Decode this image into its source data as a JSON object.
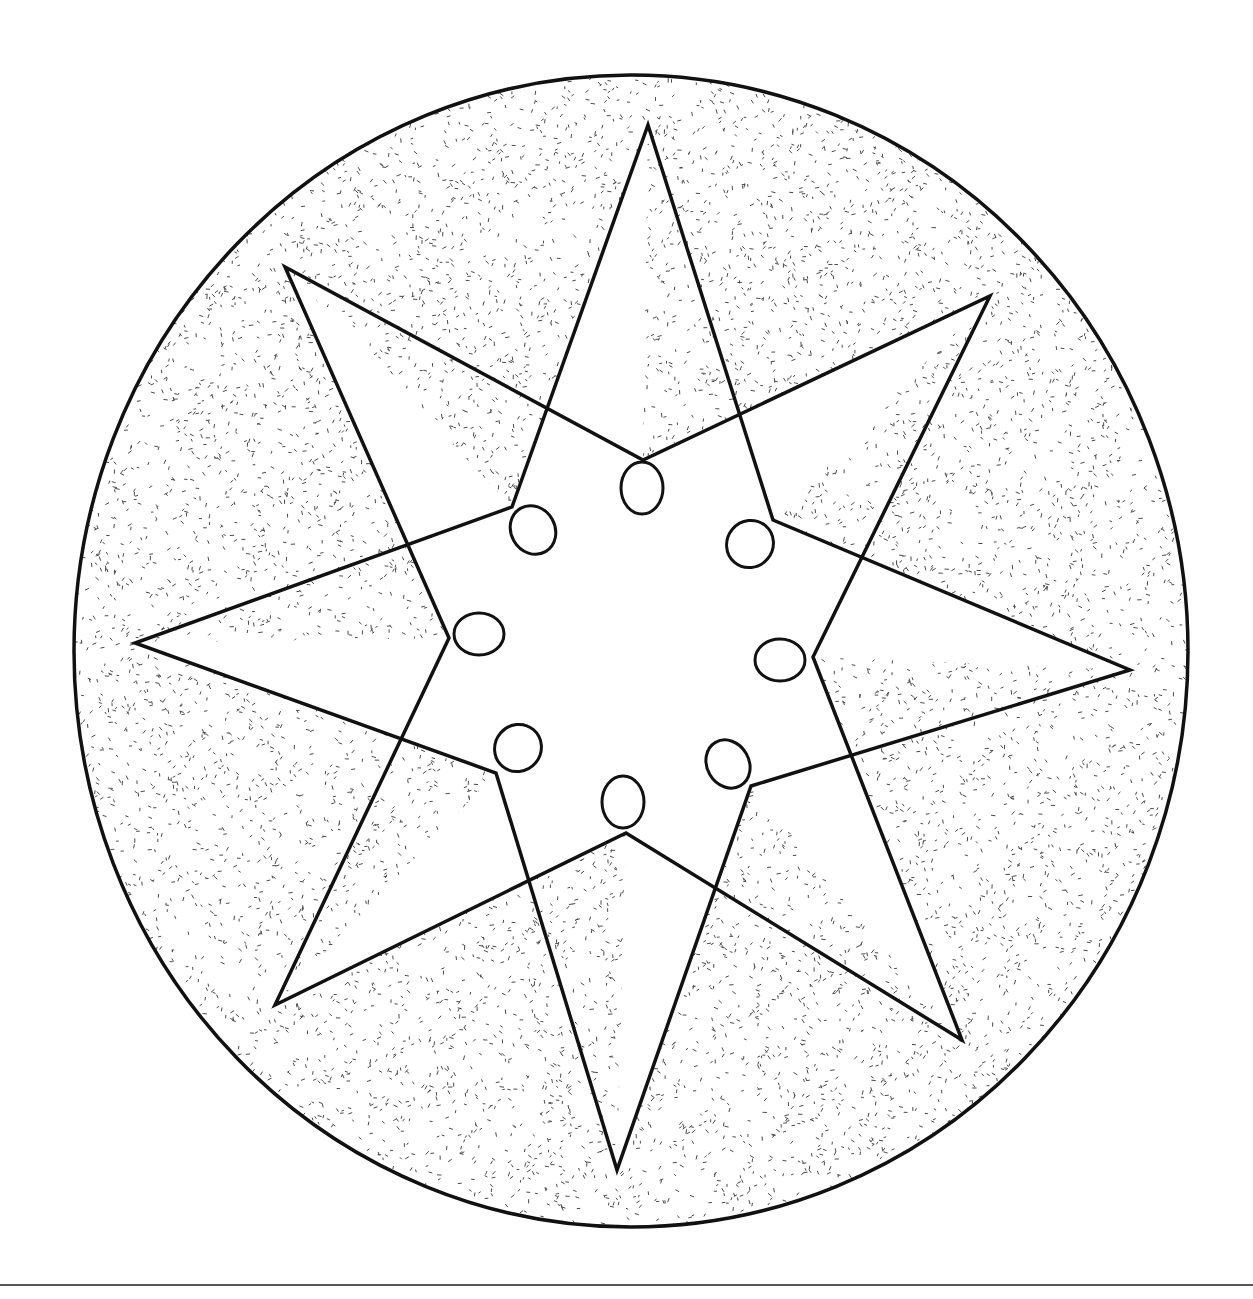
{
  "diagram": {
    "title": "",
    "colors": {
      "background": "#ffffff",
      "stroke": "#111111",
      "stipple": "#4a4a4a",
      "fill_inside": "#ffffff",
      "rule": "#555555"
    },
    "outer_circle": {
      "cx": 631,
      "cy": 651,
      "rx": 557,
      "ry": 576,
      "stroke_width": 3.5
    },
    "star": {
      "stroke_width": 3.5,
      "points": [
        [
          648,
          125
        ],
        [
          643,
          460
        ],
        [
          990,
          296
        ],
        [
          773,
          520
        ],
        [
          1130,
          670
        ],
        [
          813,
          657
        ],
        [
          962,
          1040
        ],
        [
          751,
          786
        ],
        [
          617,
          1170
        ],
        [
          626,
          833
        ],
        [
          275,
          1005
        ],
        [
          496,
          773
        ],
        [
          135,
          643
        ],
        [
          449,
          638
        ],
        [
          285,
          267
        ],
        [
          512,
          507
        ]
      ],
      "star_outline": [
        [
          648,
          125
        ],
        [
          773,
          520
        ],
        [
          1130,
          670
        ],
        [
          751,
          786
        ],
        [
          617,
          1170
        ],
        [
          496,
          773
        ],
        [
          135,
          643
        ],
        [
          512,
          507
        ]
      ],
      "star_outline_2": [
        [
          990,
          296
        ],
        [
          813,
          657
        ],
        [
          962,
          1040
        ],
        [
          626,
          833
        ],
        [
          275,
          1005
        ],
        [
          449,
          638
        ],
        [
          285,
          267
        ],
        [
          643,
          460
        ]
      ]
    },
    "inner_ring": {
      "vertices": [
        [
          643,
          460
        ],
        [
          773,
          520
        ],
        [
          813,
          657
        ],
        [
          751,
          786
        ],
        [
          626,
          833
        ],
        [
          496,
          773
        ],
        [
          449,
          638
        ],
        [
          512,
          507
        ]
      ]
    },
    "ovals": [
      {
        "cx": 642,
        "cy": 488,
        "rx": 21,
        "ry": 26,
        "rotate": 0
      },
      {
        "cx": 750,
        "cy": 544,
        "rx": 23,
        "ry": 24,
        "rotate": 40
      },
      {
        "cx": 780,
        "cy": 660,
        "rx": 25,
        "ry": 21,
        "rotate": 0
      },
      {
        "cx": 728,
        "cy": 764,
        "rx": 21,
        "ry": 25,
        "rotate": -30
      },
      {
        "cx": 623,
        "cy": 802,
        "rx": 21,
        "ry": 26,
        "rotate": 0
      },
      {
        "cx": 518,
        "cy": 748,
        "rx": 23,
        "ry": 24,
        "rotate": 40
      },
      {
        "cx": 479,
        "cy": 634,
        "rx": 25,
        "ry": 21,
        "rotate": 0
      },
      {
        "cx": 533,
        "cy": 530,
        "rx": 22,
        "ry": 25,
        "rotate": -30
      }
    ],
    "bottom_rule": {
      "x1": 0,
      "x2": 1253,
      "y": 1285,
      "stroke_width": 2
    },
    "stipple": {
      "count": 9000,
      "seed": 7
    }
  }
}
